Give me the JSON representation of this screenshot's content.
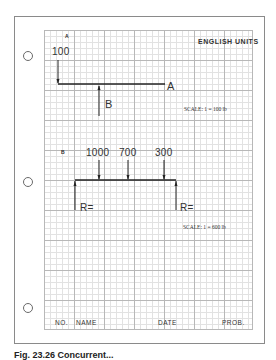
{
  "sheet": {
    "header": {
      "units_label": "ENGLISH UNITS"
    },
    "problem_a": {
      "label": "A",
      "applied_force": "100",
      "beam_end_label": "A",
      "reaction_label": "B",
      "scale": "SCALE: 1 = 100 lb"
    },
    "problem_b": {
      "label": "B",
      "loads": [
        "1000",
        "700",
        "300"
      ],
      "left_reaction": "R=",
      "right_reaction": "R=",
      "scale": "SCALE: 1 = 600 lb"
    },
    "footer": {
      "no": "NO.",
      "name": "NAME",
      "date": "DATE",
      "prob": "PROB."
    },
    "caption": "Fig. 23.26 Concurrent..."
  },
  "colors": {
    "ink": "#222222",
    "grid_major": "#b8b8b8",
    "grid_minor": "#e2e2e2",
    "paper_border": "#8a8a8a"
  }
}
